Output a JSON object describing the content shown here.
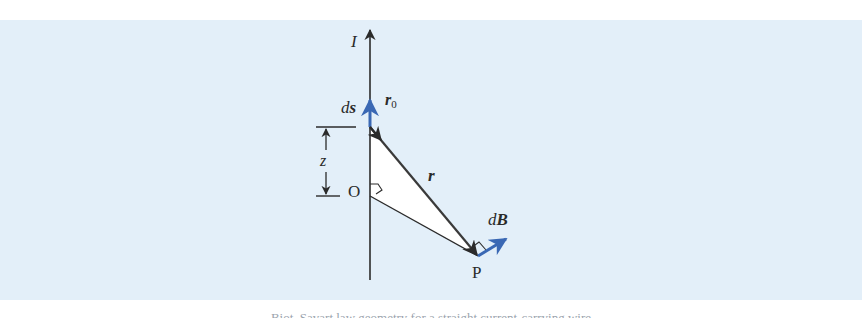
{
  "figure": {
    "background_color": "#e3eff9",
    "line_color": "#2b2b2b",
    "vector_color": "#3a68b4",
    "labels": {
      "current": "I",
      "ds_d": "d",
      "ds_s": "s",
      "r0_r": "r",
      "r0_sub": "0",
      "r": "r",
      "z": "z",
      "origin": "O",
      "point": "P",
      "dB_d": "d",
      "dB_B": "B"
    },
    "caption": "Biot–Savart law geometry for a straight current-carrying wire"
  }
}
